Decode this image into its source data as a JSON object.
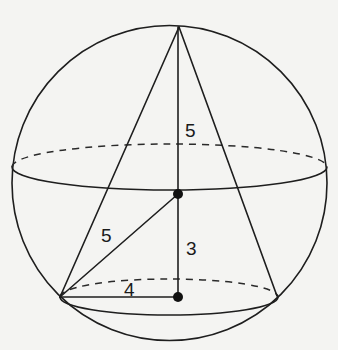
{
  "figure": {
    "colors": {
      "background": "#f4f4f2",
      "ink": "#1e1e1e"
    },
    "sphere": {
      "cx": 169.5,
      "cy": 183,
      "r": 157.5
    },
    "equator": {
      "cx": 169.5,
      "cy": 167,
      "rx": 157.5,
      "ry": 23,
      "front": "solid",
      "back": "dashed"
    },
    "base_circle": {
      "cx": 169,
      "cy": 297,
      "rx": 109,
      "ry": 18,
      "front": "solid",
      "back": "dashed"
    },
    "points": {
      "apex": {
        "x": 179,
        "y": 27
      },
      "sphere_center": {
        "x": 178,
        "y": 194
      },
      "base_center": {
        "x": 178,
        "y": 297
      },
      "base_left": {
        "x": 60,
        "y": 297
      },
      "base_right": {
        "x": 277,
        "y": 296
      }
    },
    "labels": [
      {
        "id": "upper-radius",
        "text": "5",
        "x": 185,
        "y": 137
      },
      {
        "id": "slant-radius",
        "text": "5",
        "x": 101,
        "y": 242
      },
      {
        "id": "center-to-base-height",
        "text": "3",
        "x": 186,
        "y": 255
      },
      {
        "id": "base-radius",
        "text": "4",
        "x": 124,
        "y": 296
      }
    ]
  }
}
